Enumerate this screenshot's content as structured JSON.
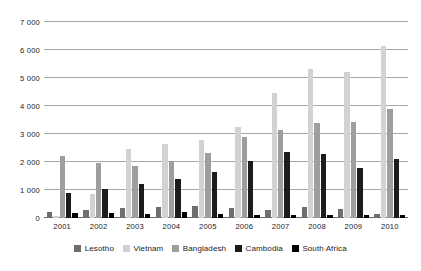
{
  "chart_data": {
    "type": "bar",
    "title": "",
    "subtitle": "",
    "xlabel": "",
    "ylabel": "",
    "ylim": [
      0,
      7000
    ],
    "ytick_values": [
      0,
      1000,
      2000,
      3000,
      4000,
      5000,
      6000,
      7000
    ],
    "ytick_labels": [
      "0",
      "1 000",
      "2 000",
      "3 000",
      "4 000",
      "5 000",
      "6 000",
      "7 000"
    ],
    "grid": true,
    "legend_position": "bottom",
    "categories": [
      "2001",
      "2002",
      "2003",
      "2004",
      "2005",
      "2006",
      "2007",
      "2008",
      "2009",
      "2010"
    ],
    "series": [
      {
        "name": "Lesotho",
        "color": "#6e6e6e",
        "values": [
          200,
          300,
          350,
          380,
          440,
          360,
          300,
          380,
          310,
          130
        ]
      },
      {
        "name": "Vietnam",
        "color": "#d2d2d2",
        "values": [
          70,
          870,
          2480,
          2650,
          2770,
          3250,
          4450,
          5320,
          5200,
          6150
        ]
      },
      {
        "name": "Bangladesh",
        "color": "#9e9e9e",
        "values": [
          2200,
          1980,
          1860,
          2030,
          2330,
          2900,
          3150,
          3380,
          3430,
          3900
        ]
      },
      {
        "name": "Cambodia",
        "color": "#1c1c1c",
        "values": [
          900,
          1050,
          1200,
          1400,
          1650,
          2050,
          2350,
          2280,
          1780,
          2100
        ]
      },
      {
        "name": "South Africa",
        "color": "#000000",
        "values": [
          180,
          180,
          160,
          200,
          130,
          100,
          90,
          100,
          100,
          90
        ]
      }
    ]
  }
}
